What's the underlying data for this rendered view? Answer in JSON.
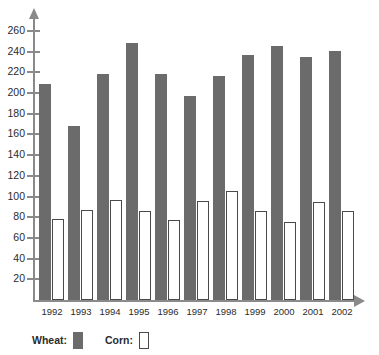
{
  "chart_data": {
    "type": "bar",
    "title": "",
    "xlabel": "",
    "ylabel": "",
    "grid": false,
    "legend_position": "bottom-left",
    "categories": [
      "1992",
      "1993",
      "1994",
      "1995",
      "1996",
      "1997",
      "1998",
      "1999",
      "2000",
      "2001",
      "2002"
    ],
    "ylim": [
      0,
      270
    ],
    "y_ticks": [
      260,
      240,
      220,
      200,
      180,
      160,
      140,
      120,
      100,
      80,
      60,
      40,
      20
    ],
    "series": [
      {
        "name": "Wheat",
        "color": "#6b6b6b",
        "style": "filled",
        "values": [
          209,
          168,
          218,
          248,
          218,
          197,
          217,
          237,
          246,
          235,
          241
        ]
      },
      {
        "name": "Corn",
        "color": "#ffffff",
        "style": "outlined",
        "values": [
          78,
          87,
          97,
          86,
          77,
          96,
          105,
          86,
          75,
          95,
          86
        ]
      }
    ]
  },
  "legend": {
    "wheat_label": "Wheat:",
    "corn_label": "Corn:"
  }
}
